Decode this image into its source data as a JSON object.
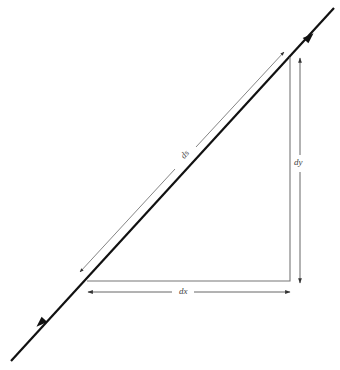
{
  "diagram": {
    "type": "differential-arc-length-triangle",
    "labels": {
      "ds": "ds",
      "dy": "dy",
      "dx": "dx"
    },
    "colors": {
      "main_line": "#111111",
      "triangle": "#777777",
      "dimension_arrows": "#555555",
      "label_text": "#444444",
      "background": "#ffffff"
    },
    "geometry": {
      "main_line": {
        "x1": 11,
        "y1": 361,
        "x2": 334,
        "y2": 8,
        "arrowheads": [
          {
            "x": 310,
            "y": 37,
            "direction": "up-right"
          },
          {
            "x": 40,
            "y": 323,
            "direction": "down-left"
          }
        ]
      },
      "triangle": {
        "points": [
          [
            87,
            281
          ],
          [
            290,
            281
          ],
          [
            290,
            57
          ]
        ]
      },
      "ds_arrow": {
        "x1": 80,
        "y1": 272,
        "x2": 284,
        "y2": 52
      },
      "dy_arrow": {
        "x": 300,
        "y1": 58,
        "y2": 283
      },
      "dx_arrow": {
        "y": 292,
        "x1": 88,
        "x2": 290
      }
    }
  }
}
